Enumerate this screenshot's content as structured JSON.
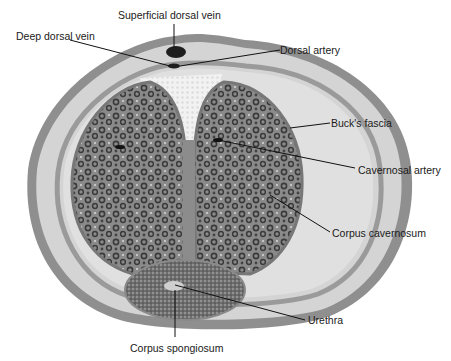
{
  "labels": {
    "superficial_dorsal_vein": "Superficial dorsal vein",
    "deep_dorsal_vein": "Deep dorsal vein",
    "dorsal_artery": "Dorsal artery",
    "bucks_fascia": "Buck's fascia",
    "cavernosal_artery": "Cavernosal artery",
    "corpus_cavernosum": "Corpus cavernosum",
    "urethra": "Urethra",
    "corpus_spongiosum": "Corpus spongiosum"
  },
  "colors": {
    "skin_outer": "#8c8c8c",
    "skin_light": "#d6d6d6",
    "fascia_band": "#9a9a9a",
    "cavernosum_fill": "#7d7d7d",
    "cavernosum_spots": "#3c3c3c",
    "spongiosum_fill": "#6a6a6a",
    "dorsal_fat": "#efefef",
    "vein": "#1e1e1e",
    "leader_line": "#111111"
  }
}
